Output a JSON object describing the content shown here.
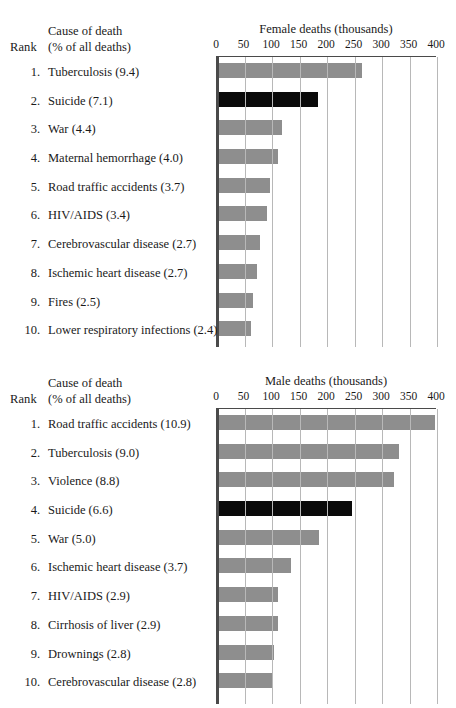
{
  "panels": [
    {
      "name": "female",
      "header": {
        "rank_label": "Rank",
        "cause_line1": "Cause of death",
        "cause_line2": "(% of all deaths)"
      },
      "chart_title": "Female deaths (thousands)"
    },
    {
      "name": "male",
      "header": {
        "rank_label": "Rank",
        "cause_line1": "Cause of death",
        "cause_line2": "(% of all deaths)"
      },
      "chart_title": "Male deaths (thousands)"
    }
  ],
  "chart_data": [
    {
      "type": "bar",
      "orientation": "horizontal",
      "title": "Female deaths (thousands)",
      "xlabel": "Female deaths (thousands)",
      "ylabel": "",
      "xlim": [
        0,
        400
      ],
      "xticks": [
        0,
        50,
        100,
        150,
        200,
        250,
        300,
        350,
        400
      ],
      "tick_labels": [
        "0",
        "50",
        "100",
        "150",
        "200",
        "250",
        "300",
        "350",
        "400"
      ],
      "grid": true,
      "legend": "none",
      "ranks": [
        "1.",
        "2.",
        "3.",
        "4.",
        "5.",
        "6.",
        "7.",
        "8.",
        "9.",
        "10."
      ],
      "categories": [
        "Tuberculosis (9.4)",
        "Suicide (7.1)",
        "War (4.4)",
        "Maternal hemorrhage (4.0)",
        "Road traffic accidents (3.7)",
        "HIV/AIDS (3.4)",
        "Cerebrovascular disease (2.7)",
        "Ischemic heart disease (2.7)",
        "Fires (2.5)",
        "Lower respiratory infections (2.4)"
      ],
      "percentages": [
        9.4,
        7.1,
        4.4,
        4.0,
        3.7,
        3.4,
        2.7,
        2.7,
        2.5,
        2.4
      ],
      "values": [
        264,
        183,
        118,
        110,
        96,
        90,
        78,
        72,
        66,
        62
      ],
      "highlight_index": 1,
      "highlight_color": "#0a0a0a",
      "bar_color": "#8e8e8e"
    },
    {
      "type": "bar",
      "orientation": "horizontal",
      "title": "Male deaths (thousands)",
      "xlabel": "Male deaths (thousands)",
      "ylabel": "",
      "xlim": [
        0,
        400
      ],
      "xticks": [
        0,
        50,
        100,
        150,
        200,
        250,
        300,
        350,
        400
      ],
      "tick_labels": [
        "0",
        "50",
        "100",
        "150",
        "200",
        "250",
        "300",
        "350",
        "400"
      ],
      "grid": true,
      "legend": "none",
      "ranks": [
        "1.",
        "2.",
        "3.",
        "4.",
        "5.",
        "6.",
        "7.",
        "8.",
        "9.",
        "10."
      ],
      "categories": [
        "Road traffic accidents (10.9)",
        "Tuberculosis (9.0)",
        "Violence (8.8)",
        "Suicide (6.6)",
        "War (5.0)",
        "Ischemic heart disease (3.7)",
        "HIV/AIDS (2.9)",
        "Cirrhosis of liver (2.9)",
        "Drownings (2.8)",
        "Cerebrovascular disease (2.8)"
      ],
      "percentages": [
        10.9,
        9.0,
        8.8,
        6.6,
        5.0,
        3.7,
        2.9,
        2.9,
        2.8,
        2.8
      ],
      "values": [
        396,
        330,
        322,
        245,
        185,
        135,
        111,
        110,
        103,
        102
      ],
      "highlight_index": 3,
      "highlight_color": "#0a0a0a",
      "bar_color": "#8e8e8e"
    }
  ]
}
